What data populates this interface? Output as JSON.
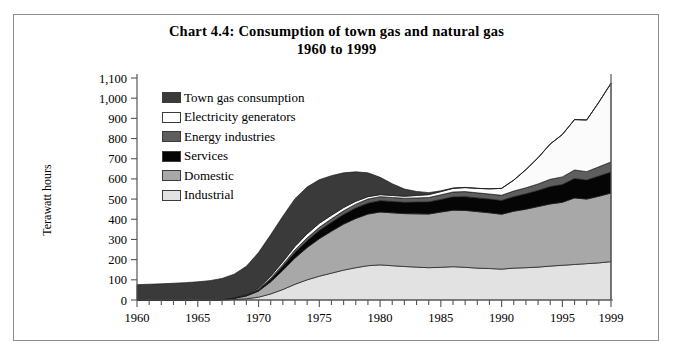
{
  "chart_data": {
    "type": "area",
    "stacked": true,
    "title": "Chart 4.4:  Consumption of town gas and natural gas",
    "subtitle": "1960 to 1999",
    "xlabel": "",
    "ylabel": "Terawatt hours",
    "ylim": [
      0,
      1100
    ],
    "ytick_step": 100,
    "ytick_labels": [
      "1,100",
      "1,000",
      "900",
      "800",
      "700",
      "600",
      "500",
      "400",
      "300",
      "200",
      "100",
      "0"
    ],
    "ytick_values": [
      1100,
      1000,
      900,
      800,
      700,
      600,
      500,
      400,
      300,
      200,
      100,
      0
    ],
    "xlim": [
      1960,
      1999
    ],
    "xtick_labels": [
      "1960",
      "1965",
      "1970",
      "1975",
      "1980",
      "1985",
      "1990",
      "1995",
      "1999"
    ],
    "xtick_values": [
      1960,
      1965,
      1970,
      1975,
      1980,
      1985,
      1990,
      1995,
      1999
    ],
    "grid": false,
    "legend_position": "upper-left-inside",
    "x": [
      1960,
      1961,
      1962,
      1963,
      1964,
      1965,
      1966,
      1967,
      1968,
      1969,
      1970,
      1971,
      1972,
      1973,
      1974,
      1975,
      1976,
      1977,
      1978,
      1979,
      1980,
      1981,
      1982,
      1983,
      1984,
      1985,
      1986,
      1987,
      1988,
      1989,
      1990,
      1991,
      1992,
      1993,
      1994,
      1995,
      1996,
      1997,
      1998,
      1999
    ],
    "stack_order_bottom_to_top": [
      "Industrial",
      "Domestic",
      "Services",
      "Energy industries",
      "Electricity generators",
      "Town gas consumption"
    ],
    "series": [
      {
        "name": "Industrial",
        "color": "#e2e2e2",
        "values": [
          0,
          0,
          0,
          0,
          0,
          0,
          0,
          0,
          2,
          6,
          14,
          30,
          52,
          78,
          100,
          118,
          133,
          148,
          160,
          170,
          174,
          170,
          166,
          163,
          160,
          162,
          165,
          162,
          158,
          156,
          153,
          158,
          160,
          163,
          168,
          172,
          176,
          180,
          184,
          190
        ]
      },
      {
        "name": "Domestic",
        "color": "#a8a8a8",
        "values": [
          0,
          0,
          0,
          0,
          0,
          0,
          0,
          2,
          6,
          14,
          30,
          60,
          95,
          130,
          160,
          186,
          208,
          228,
          244,
          256,
          262,
          262,
          262,
          264,
          266,
          274,
          280,
          282,
          280,
          276,
          272,
          282,
          290,
          300,
          308,
          312,
          330,
          320,
          330,
          340
        ]
      },
      {
        "name": "Services",
        "color": "#050505",
        "values": [
          0,
          0,
          0,
          0,
          0,
          0,
          0,
          0,
          1,
          3,
          6,
          12,
          20,
          28,
          34,
          40,
          44,
          48,
          52,
          54,
          56,
          56,
          56,
          58,
          60,
          62,
          66,
          68,
          68,
          68,
          68,
          72,
          76,
          80,
          86,
          88,
          96,
          94,
          100,
          104
        ]
      },
      {
        "name": "Energy industries",
        "color": "#5e5e5e",
        "values": [
          0,
          0,
          0,
          0,
          0,
          0,
          0,
          0,
          1,
          2,
          4,
          6,
          9,
          12,
          14,
          16,
          17,
          18,
          19,
          20,
          20,
          20,
          20,
          21,
          22,
          23,
          24,
          25,
          25,
          25,
          26,
          28,
          30,
          32,
          36,
          38,
          42,
          42,
          46,
          50
        ]
      },
      {
        "name": "Electricity generators",
        "color": "#fbfbfb",
        "values": [
          0,
          0,
          0,
          0,
          0,
          0,
          0,
          0,
          0,
          2,
          6,
          10,
          14,
          18,
          20,
          20,
          18,
          16,
          14,
          12,
          10,
          10,
          10,
          12,
          14,
          16,
          18,
          20,
          22,
          26,
          34,
          54,
          90,
          130,
          175,
          210,
          250,
          256,
          320,
          390
        ]
      },
      {
        "name": "Town gas consumption",
        "color": "#3a3a3a",
        "values": [
          76,
          78,
          80,
          83,
          86,
          90,
          96,
          105,
          118,
          140,
          175,
          205,
          225,
          236,
          232,
          216,
          196,
          172,
          146,
          118,
          86,
          58,
          36,
          20,
          10,
          4,
          2,
          1,
          0,
          0,
          0,
          0,
          0,
          0,
          0,
          0,
          0,
          0,
          0,
          0
        ]
      }
    ],
    "totals_note_points": {
      "1960": 76,
      "1970": 235,
      "1980": 608,
      "1990": 553,
      "1999": 1074
    }
  },
  "legend": {
    "items": [
      {
        "label": "Town gas consumption",
        "color": "#3a3a3a"
      },
      {
        "label": "Electricity generators",
        "color": "#ffffff"
      },
      {
        "label": "Energy industries",
        "color": "#5e5e5e"
      },
      {
        "label": "Services",
        "color": "#050505"
      },
      {
        "label": "Domestic",
        "color": "#a8a8a8"
      },
      {
        "label": "Industrial",
        "color": "#e2e2e2"
      }
    ]
  },
  "axis": {
    "y_title": "Terawatt hours"
  }
}
